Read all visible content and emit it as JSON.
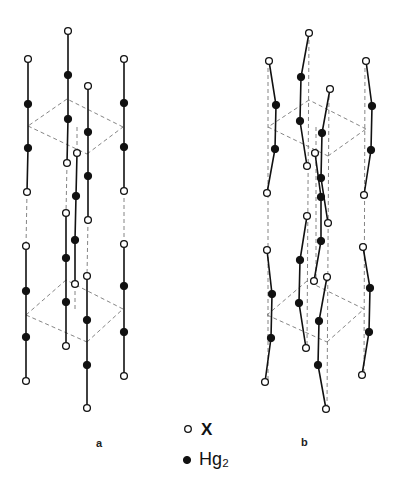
{
  "figure": {
    "panel_labels": {
      "a": "a",
      "b": "b"
    },
    "legend": [
      {
        "symbol": "open-circle",
        "label": "X"
      },
      {
        "symbol": "filled-circle",
        "label": "Hg₂"
      }
    ]
  },
  "panels": {
    "a": {
      "chains": [
        [
          [
            28,
            59,
            "o"
          ],
          [
            28,
            104,
            "f"
          ],
          [
            28,
            148,
            "f"
          ],
          [
            27,
            192,
            "o"
          ]
        ],
        [
          [
            26,
            246,
            "o"
          ],
          [
            26,
            291,
            "f"
          ],
          [
            26,
            337,
            "f"
          ],
          [
            26,
            381,
            "o"
          ]
        ],
        [
          [
            68,
            31,
            "o"
          ],
          [
            68,
            75,
            "f"
          ],
          [
            68,
            119,
            "f"
          ],
          [
            67,
            163,
            "o"
          ]
        ],
        [
          [
            66,
            213,
            "o"
          ],
          [
            66,
            258,
            "f"
          ],
          [
            66,
            302,
            "f"
          ],
          [
            66,
            346,
            "o"
          ]
        ],
        [
          [
            88,
            86,
            "o"
          ],
          [
            88,
            132,
            "f"
          ],
          [
            88,
            176,
            "f"
          ],
          [
            88,
            220,
            "o"
          ]
        ],
        [
          [
            87,
            276,
            "o"
          ],
          [
            87,
            320,
            "f"
          ],
          [
            87,
            365,
            "f"
          ],
          [
            87,
            408,
            "o"
          ]
        ],
        [
          [
            77,
            153,
            "o"
          ],
          [
            76,
            196,
            "f"
          ],
          [
            75,
            240,
            "f"
          ],
          [
            75,
            284,
            "o"
          ]
        ],
        [
          [
            124,
            59,
            "o"
          ],
          [
            124,
            103,
            "f"
          ],
          [
            124,
            147,
            "f"
          ],
          [
            124,
            191,
            "o"
          ]
        ],
        [
          [
            124,
            244,
            "o"
          ],
          [
            124,
            286,
            "f"
          ],
          [
            124,
            332,
            "f"
          ],
          [
            124,
            376,
            "o"
          ]
        ]
      ],
      "dashed": [
        [
          [
            27,
            192
          ],
          [
            26,
            246
          ]
        ],
        [
          [
            67,
            163
          ],
          [
            66,
            213
          ]
        ],
        [
          [
            88,
            220
          ],
          [
            87,
            276
          ]
        ],
        [
          [
            124,
            191
          ],
          [
            124,
            244
          ]
        ],
        [
          [
            77,
            127
          ],
          [
            77,
            153
          ]
        ],
        [
          [
            75,
            284
          ],
          [
            75,
            312
          ]
        ],
        [
          [
            67,
            99
          ],
          [
            28,
            126
          ]
        ],
        [
          [
            28,
            126
          ],
          [
            87,
            154
          ]
        ],
        [
          [
            87,
            154
          ],
          [
            123,
            127
          ]
        ],
        [
          [
            123,
            127
          ],
          [
            67,
            99
          ]
        ],
        [
          [
            66,
            280
          ],
          [
            26,
            315
          ]
        ],
        [
          [
            26,
            315
          ],
          [
            87,
            342
          ]
        ],
        [
          [
            87,
            342
          ],
          [
            123,
            309
          ]
        ],
        [
          [
            123,
            309
          ],
          [
            66,
            280
          ]
        ]
      ]
    },
    "b": {
      "chains": [
        [
          [
            269,
            61,
            "o"
          ],
          [
            276,
            105,
            "f"
          ],
          [
            275,
            149,
            "f"
          ],
          [
            267,
            193,
            "o"
          ]
        ],
        [
          [
            267,
            250,
            "o"
          ],
          [
            272,
            294,
            "f"
          ],
          [
            271,
            338,
            "f"
          ],
          [
            265,
            382,
            "o"
          ]
        ],
        [
          [
            309,
            33,
            "o"
          ],
          [
            301,
            77,
            "f"
          ],
          [
            300,
            121,
            "f"
          ],
          [
            307,
            166,
            "o"
          ]
        ],
        [
          [
            307,
            216,
            "o"
          ],
          [
            300,
            260,
            "f"
          ],
          [
            299,
            303,
            "f"
          ],
          [
            306,
            348,
            "o"
          ]
        ],
        [
          [
            330,
            89,
            "o"
          ],
          [
            322,
            133,
            "f"
          ],
          [
            321,
            178,
            "f"
          ],
          [
            328,
            223,
            "o"
          ]
        ],
        [
          [
            327,
            277,
            "o"
          ],
          [
            319,
            321,
            "f"
          ],
          [
            318,
            365,
            "f"
          ],
          [
            326,
            409,
            "o"
          ]
        ],
        [
          [
            315,
            153,
            "o"
          ],
          [
            321,
            197,
            "f"
          ],
          [
            321,
            241,
            "f"
          ],
          [
            314,
            281,
            "o"
          ]
        ],
        [
          [
            366,
            61,
            "o"
          ],
          [
            372,
            106,
            "f"
          ],
          [
            371,
            150,
            "f"
          ],
          [
            364,
            195,
            "o"
          ]
        ],
        [
          [
            363,
            247,
            "o"
          ],
          [
            370,
            288,
            "f"
          ],
          [
            369,
            332,
            "f"
          ],
          [
            362,
            375,
            "o"
          ]
        ]
      ],
      "dashed": [
        [
          [
            268,
            61
          ],
          [
            268,
            382
          ]
        ],
        [
          [
            309,
            33
          ],
          [
            307,
            348
          ]
        ],
        [
          [
            329,
            89
          ],
          [
            327,
            409
          ]
        ],
        [
          [
            365,
            61
          ],
          [
            364,
            375
          ]
        ],
        [
          [
            316,
            127
          ],
          [
            316,
            281
          ]
        ],
        [
          [
            309,
            100
          ],
          [
            268,
            127
          ]
        ],
        [
          [
            268,
            127
          ],
          [
            328,
            156
          ]
        ],
        [
          [
            328,
            156
          ],
          [
            366,
            129
          ]
        ],
        [
          [
            366,
            129
          ],
          [
            309,
            100
          ]
        ],
        [
          [
            307,
            281
          ],
          [
            267,
            315
          ]
        ],
        [
          [
            267,
            315
          ],
          [
            327,
            342
          ]
        ],
        [
          [
            327,
            342
          ],
          [
            364,
            309
          ]
        ],
        [
          [
            364,
            309
          ],
          [
            307,
            281
          ]
        ]
      ]
    }
  }
}
